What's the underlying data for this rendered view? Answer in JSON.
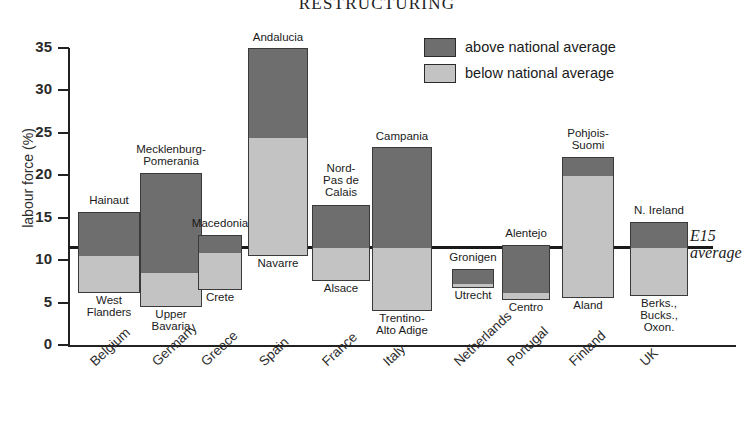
{
  "title": "RESTRUCTURING",
  "legend": {
    "position": "top-right",
    "items": [
      {
        "label": "above national average",
        "color": "#6e6e6e",
        "key": "above"
      },
      {
        "label": "below national average",
        "color": "#c3c3c3",
        "key": "below"
      }
    ]
  },
  "average_line": {
    "label_line1": "E15",
    "label_line2": "average",
    "value": 11.5
  },
  "axis": {
    "ylabel": "labour force (%)",
    "yticks": [
      "0",
      "5",
      "10",
      "15",
      "20",
      "25",
      "30",
      "35"
    ]
  },
  "chart_data": {
    "type": "bar",
    "title": "RESTRUCTURING",
    "xlabel": "",
    "ylabel": "labour force (%)",
    "ylim": [
      0,
      35
    ],
    "yticks": [
      0,
      5,
      10,
      15,
      20,
      25,
      30,
      35
    ],
    "grid": false,
    "legend_position": "top-right",
    "reference_line": {
      "name": "E15 average",
      "value": 11.5
    },
    "note": "Each country shows a single floating bar spanning its lowest-region value to its highest-region value; the dark segment lies above the national average and the light segment below it.",
    "categories": [
      "Belgium",
      "Germany",
      "Greece",
      "Spain",
      "France",
      "Italy",
      "Netherlands",
      "Portugal",
      "Finland",
      "UK"
    ],
    "series": [
      {
        "name": "above national average",
        "key": "above",
        "color": "#6e6e6e",
        "values": [
          {
            "category": "Belgium",
            "from": 10.6,
            "to": 15.7
          },
          {
            "category": "Germany",
            "from": 8.6,
            "to": 20.3
          },
          {
            "category": "Greece",
            "from": 11.0,
            "to": 13.0
          },
          {
            "category": "Spain",
            "from": 24.5,
            "to": 35.0
          },
          {
            "category": "France",
            "from": 11.5,
            "to": 16.5
          },
          {
            "category": "Italy",
            "from": 11.6,
            "to": 23.3
          },
          {
            "category": "Netherlands",
            "from": 7.3,
            "to": 9.0
          },
          {
            "category": "Portugal",
            "from": 6.3,
            "to": 11.8
          },
          {
            "category": "Finland",
            "from": 20.0,
            "to": 22.2
          },
          {
            "category": "UK",
            "from": 11.5,
            "to": 14.5
          }
        ]
      },
      {
        "name": "below national average",
        "key": "below",
        "color": "#c3c3c3",
        "values": [
          {
            "category": "Belgium",
            "from": 6.1,
            "to": 10.6
          },
          {
            "category": "Germany",
            "from": 4.5,
            "to": 8.6
          },
          {
            "category": "Greece",
            "from": 6.5,
            "to": 11.0
          },
          {
            "category": "Spain",
            "from": 10.5,
            "to": 24.5
          },
          {
            "category": "France",
            "from": 7.5,
            "to": 11.5
          },
          {
            "category": "Italy",
            "from": 4.0,
            "to": 11.6
          },
          {
            "category": "Netherlands",
            "from": 6.7,
            "to": 7.3
          },
          {
            "category": "Portugal",
            "from": 5.3,
            "to": 6.3
          },
          {
            "category": "Finland",
            "from": 5.5,
            "to": 20.0
          },
          {
            "category": "UK",
            "from": 5.8,
            "to": 11.5
          }
        ]
      }
    ],
    "region_labels": [
      {
        "category": "Belgium",
        "top": "Hainaut",
        "bottom": "West\nFlanders"
      },
      {
        "category": "Germany",
        "top": "Mecklenburg-\nPomerania",
        "bottom": "Upper\nBavaria"
      },
      {
        "category": "Greece",
        "top": "Macedonia",
        "bottom": "Crete"
      },
      {
        "category": "Spain",
        "top": "Andalucia",
        "bottom": "Navarre"
      },
      {
        "category": "France",
        "top": "Nord-\nPas de\nCalais",
        "bottom": "Alsace"
      },
      {
        "category": "Italy",
        "top": "Campania",
        "bottom": "Trentino-\nAlto Adige"
      },
      {
        "category": "Netherlands",
        "top": "Gronigen",
        "bottom": "Utrecht"
      },
      {
        "category": "Portugal",
        "top": "Alentejo",
        "bottom": "Centro"
      },
      {
        "category": "Finland",
        "top": "Pohjois-\nSuomi",
        "bottom": "Aland"
      },
      {
        "category": "UK",
        "top": "N. Ireland",
        "bottom": "Berks.,\nBucks.,\nOxon."
      }
    ]
  },
  "colors": {
    "above": "#6e6e6e",
    "below": "#c3c3c3",
    "axis": "#222222",
    "text": "#1a1a1a"
  }
}
